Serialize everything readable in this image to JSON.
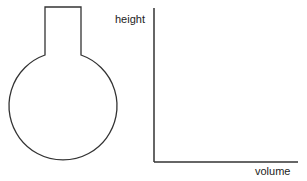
{
  "diagram": {
    "flask": {
      "shape": "round-bottom flask with cylindrical neck"
    },
    "axes": {
      "y_label": "height",
      "x_label": "volume"
    },
    "colors": {
      "stroke": "#333333",
      "background": "#ffffff"
    }
  }
}
